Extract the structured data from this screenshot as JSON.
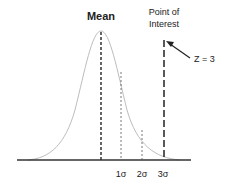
{
  "title": "Mean",
  "point_label_line1": "Point of",
  "point_label_line2": "Interest",
  "z_label": "Z = 3",
  "sigma_labels": [
    "1σ",
    "2σ",
    "3σ"
  ],
  "colors": {
    "curve": "#bdbdbd",
    "axis": "#333333",
    "lines": "#333333",
    "text": "#222222"
  }
}
